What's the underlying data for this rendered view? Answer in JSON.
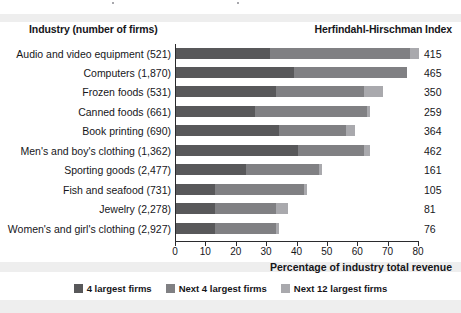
{
  "header": {
    "industry_label": "Industry (number of firms)",
    "index_label": "Herfindahl-Hirschman Index"
  },
  "axis": {
    "xlabel": "Percentage of industry total revenue",
    "ticks": [
      "0",
      "10",
      "20",
      "30",
      "40",
      "50",
      "60",
      "70",
      "80"
    ]
  },
  "legend": {
    "items": [
      {
        "label": "4 largest firms",
        "color": "#58585a"
      },
      {
        "label": "Next 4 largest firms",
        "color": "#808083"
      },
      {
        "label": "Next 12 largest firms",
        "color": "#a9a9ad"
      }
    ]
  },
  "rows": [
    {
      "label": "Audio and video equipment  (521)",
      "hhi": "415"
    },
    {
      "label": "Computers  (1,870)",
      "hhi": "465"
    },
    {
      "label": "Frozen foods  (531)",
      "hhi": "350"
    },
    {
      "label": "Canned foods  (661)",
      "hhi": "259"
    },
    {
      "label": "Book printing  (690)",
      "hhi": "364"
    },
    {
      "label": "Men's and boy's clothing  (1,362)",
      "hhi": "462"
    },
    {
      "label": "Sporting goods  (2,477)",
      "hhi": "161"
    },
    {
      "label": "Fish and seafood  (731)",
      "hhi": "105"
    },
    {
      "label": "Jewelry  (2,278)",
      "hhi": "81"
    },
    {
      "label": "Women's and girl's clothing  (2,927)",
      "hhi": "76"
    }
  ],
  "chart_data": {
    "type": "bar",
    "orientation": "horizontal",
    "stacked": true,
    "title": "",
    "xlabel": "Percentage of industry total revenue",
    "ylabel": "Industry (number of firms)",
    "xlim": [
      0,
      80
    ],
    "xticks": [
      0,
      10,
      20,
      30,
      40,
      50,
      60,
      70,
      80
    ],
    "grid": false,
    "legend_position": "bottom",
    "categories": [
      "Audio and video equipment  (521)",
      "Computers  (1,870)",
      "Frozen foods  (531)",
      "Canned foods  (661)",
      "Book printing  (690)",
      "Men's and boy's clothing  (1,362)",
      "Sporting goods  (2,477)",
      "Fish and seafood  (731)",
      "Jewelry  (2,278)",
      "Women's and girl's clothing  (2,927)"
    ],
    "series": [
      {
        "name": "4 largest firms",
        "color": "#58585a",
        "values": [
          31,
          39,
          33,
          26,
          34,
          40,
          23,
          13,
          13,
          13
        ]
      },
      {
        "name": "Next 4 largest firms",
        "color": "#808083",
        "values": [
          46,
          37,
          29,
          37,
          22,
          22,
          24,
          29,
          20,
          20
        ]
      },
      {
        "name": "Next 12 largest firms",
        "color": "#a9a9ad",
        "values": [
          3,
          0,
          6,
          1,
          3,
          2,
          1,
          1,
          4,
          1
        ]
      }
    ],
    "annotations": {
      "right_axis_label": "Herfindahl-Hirschman Index",
      "right_values": [
        415,
        465,
        350,
        259,
        364,
        462,
        161,
        105,
        81,
        76
      ]
    }
  }
}
